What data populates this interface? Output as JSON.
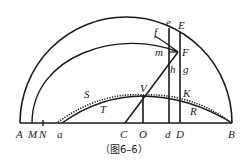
{
  "figure": {
    "caption": "（图6–6）",
    "labels": {
      "A": "A",
      "M": "M",
      "N": "N",
      "a": "a",
      "C": "C",
      "O": "O",
      "d": "d",
      "D": "D",
      "B": "B",
      "e": "e",
      "E": "E",
      "f": "f",
      "m": "m",
      "F": "F",
      "h": "h",
      "g": "g",
      "V": "V",
      "K": "K",
      "S": "S",
      "T": "T",
      "R": "R"
    },
    "colors": {
      "stroke": "#1a1a1a",
      "background": "#ffffff"
    }
  }
}
